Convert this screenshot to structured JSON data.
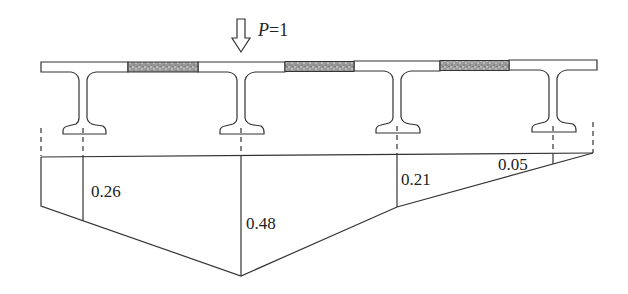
{
  "figure": {
    "type": "influence-line-diagram"
  },
  "load": {
    "symbol": "P",
    "equals": "=1",
    "label": "P=1",
    "position_girder_index": 1
  },
  "cross_section": {
    "girders_count": 4,
    "wet_joints_count": 3
  },
  "influence_line": {
    "ordinates": [
      {
        "girder": 1,
        "value": "0.26"
      },
      {
        "girder": 2,
        "value": "0.48"
      },
      {
        "girder": 3,
        "value": "0.21"
      },
      {
        "girder": 4,
        "value": "0.05"
      }
    ]
  },
  "colors": {
    "line": "#333333",
    "joint_fill": "#8a8a8a",
    "background": "#ffffff"
  }
}
